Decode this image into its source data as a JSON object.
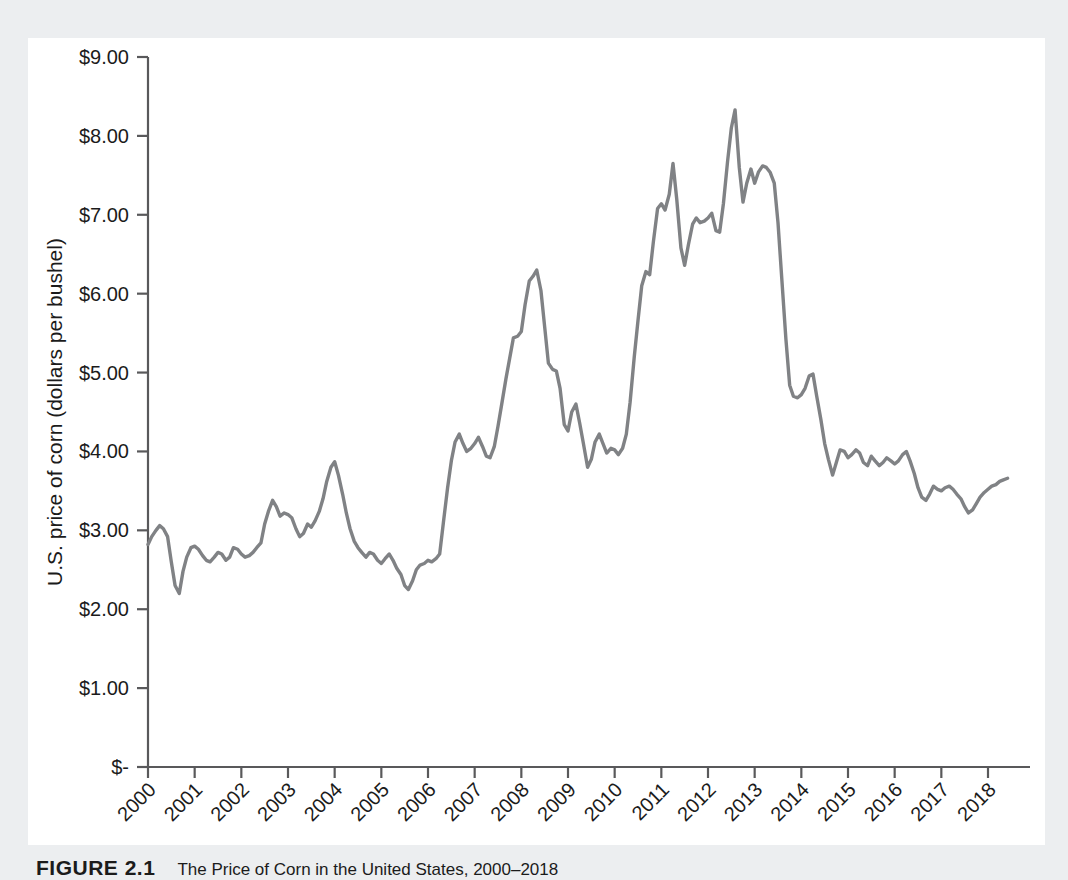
{
  "figure": {
    "caption_number": "FIGURE 2.1",
    "caption_text": "The Price of Corn in the United States, 2000–2018"
  },
  "chart_data": {
    "type": "line",
    "title": "",
    "xlabel": "",
    "ylabel": "U.S. price of corn (dollars per bushel)",
    "ylim": [
      0,
      9
    ],
    "xlim": [
      2000,
      2018.9
    ],
    "grid": false,
    "legend": "none",
    "line_color": "#808285",
    "axis_color": "#59595b",
    "background_color": "#ffffff",
    "page_background_color": "#eceef0",
    "ytick_values": [
      0,
      1,
      2,
      3,
      4,
      5,
      6,
      7,
      8,
      9
    ],
    "ytick_labels": [
      "$-",
      "$1.00",
      "$2.00",
      "$3.00",
      "$4.00",
      "$5.00",
      "$6.00",
      "$7.00",
      "$8.00",
      "$9.00"
    ],
    "xtick_values": [
      2000,
      2001,
      2002,
      2003,
      2004,
      2005,
      2006,
      2007,
      2008,
      2009,
      2010,
      2011,
      2012,
      2013,
      2014,
      2015,
      2016,
      2017,
      2018
    ],
    "xtick_labels": [
      "2000",
      "2001",
      "2002",
      "2003",
      "2004",
      "2005",
      "2006",
      "2007",
      "2008",
      "2009",
      "2010",
      "2011",
      "2012",
      "2013",
      "2014",
      "2015",
      "2016",
      "2017",
      "2018"
    ],
    "xtick_rotation_degrees": 45,
    "series": [
      {
        "name": "U.S. price of corn",
        "x": [
          2000.0,
          2000.08,
          2000.17,
          2000.25,
          2000.33,
          2000.42,
          2000.5,
          2000.58,
          2000.67,
          2000.75,
          2000.83,
          2000.92,
          2001.0,
          2001.08,
          2001.17,
          2001.25,
          2001.33,
          2001.42,
          2001.5,
          2001.58,
          2001.67,
          2001.75,
          2001.83,
          2001.92,
          2002.0,
          2002.08,
          2002.17,
          2002.25,
          2002.33,
          2002.42,
          2002.5,
          2002.58,
          2002.67,
          2002.75,
          2002.83,
          2002.92,
          2003.0,
          2003.08,
          2003.17,
          2003.25,
          2003.33,
          2003.42,
          2003.5,
          2003.58,
          2003.67,
          2003.75,
          2003.83,
          2003.92,
          2004.0,
          2004.08,
          2004.17,
          2004.25,
          2004.33,
          2004.42,
          2004.5,
          2004.58,
          2004.67,
          2004.75,
          2004.83,
          2004.92,
          2005.0,
          2005.08,
          2005.17,
          2005.25,
          2005.33,
          2005.42,
          2005.5,
          2005.58,
          2005.67,
          2005.75,
          2005.83,
          2005.92,
          2006.0,
          2006.08,
          2006.17,
          2006.25,
          2006.33,
          2006.42,
          2006.5,
          2006.58,
          2006.67,
          2006.75,
          2006.83,
          2006.92,
          2007.0,
          2007.08,
          2007.17,
          2007.25,
          2007.33,
          2007.42,
          2007.5,
          2007.58,
          2007.67,
          2007.75,
          2007.83,
          2007.92,
          2008.0,
          2008.08,
          2008.17,
          2008.25,
          2008.33,
          2008.42,
          2008.5,
          2008.58,
          2008.67,
          2008.75,
          2008.83,
          2008.92,
          2009.0,
          2009.08,
          2009.17,
          2009.25,
          2009.33,
          2009.42,
          2009.5,
          2009.58,
          2009.67,
          2009.75,
          2009.83,
          2009.92,
          2010.0,
          2010.08,
          2010.17,
          2010.25,
          2010.33,
          2010.42,
          2010.5,
          2010.58,
          2010.67,
          2010.75,
          2010.83,
          2010.92,
          2011.0,
          2011.08,
          2011.17,
          2011.25,
          2011.33,
          2011.42,
          2011.5,
          2011.58,
          2011.67,
          2011.75,
          2011.83,
          2011.92,
          2012.0,
          2012.08,
          2012.17,
          2012.25,
          2012.33,
          2012.42,
          2012.5,
          2012.58,
          2012.67,
          2012.75,
          2012.83,
          2012.92,
          2013.0,
          2013.08,
          2013.17,
          2013.25,
          2013.33,
          2013.42,
          2013.5,
          2013.58,
          2013.67,
          2013.75,
          2013.83,
          2013.92,
          2014.0,
          2014.08,
          2014.17,
          2014.25,
          2014.33,
          2014.42,
          2014.5,
          2014.58,
          2014.67,
          2014.75,
          2014.83,
          2014.92,
          2015.0,
          2015.08,
          2015.17,
          2015.25,
          2015.33,
          2015.42,
          2015.5,
          2015.58,
          2015.67,
          2015.75,
          2015.83,
          2015.92,
          2016.0,
          2016.08,
          2016.17,
          2016.25,
          2016.33,
          2016.42,
          2016.5,
          2016.58,
          2016.67,
          2016.75,
          2016.83,
          2016.92,
          2017.0,
          2017.08,
          2017.17,
          2017.25,
          2017.33,
          2017.42,
          2017.5,
          2017.58,
          2017.67,
          2017.75,
          2017.83,
          2017.92,
          2018.0,
          2018.08,
          2018.17,
          2018.25,
          2018.33,
          2018.42
        ],
        "y": [
          2.82,
          2.92,
          3.0,
          3.06,
          3.02,
          2.92,
          2.6,
          2.3,
          2.2,
          2.48,
          2.66,
          2.78,
          2.8,
          2.76,
          2.68,
          2.62,
          2.6,
          2.66,
          2.72,
          2.7,
          2.62,
          2.66,
          2.78,
          2.76,
          2.7,
          2.66,
          2.68,
          2.72,
          2.78,
          2.84,
          3.08,
          3.24,
          3.38,
          3.3,
          3.18,
          3.22,
          3.2,
          3.16,
          3.02,
          2.92,
          2.96,
          3.08,
          3.04,
          3.12,
          3.24,
          3.4,
          3.62,
          3.8,
          3.87,
          3.7,
          3.46,
          3.22,
          3.02,
          2.86,
          2.78,
          2.72,
          2.66,
          2.72,
          2.7,
          2.62,
          2.58,
          2.64,
          2.7,
          2.62,
          2.52,
          2.44,
          2.3,
          2.25,
          2.36,
          2.5,
          2.56,
          2.58,
          2.62,
          2.6,
          2.64,
          2.7,
          3.1,
          3.54,
          3.88,
          4.12,
          4.22,
          4.1,
          4.0,
          4.04,
          4.1,
          4.18,
          4.06,
          3.94,
          3.92,
          4.06,
          4.32,
          4.6,
          4.92,
          5.18,
          5.44,
          5.46,
          5.52,
          5.86,
          6.16,
          6.22,
          6.3,
          6.04,
          5.58,
          5.12,
          5.04,
          5.02,
          4.8,
          4.34,
          4.26,
          4.5,
          4.6,
          4.36,
          4.1,
          3.8,
          3.9,
          4.12,
          4.22,
          4.1,
          3.98,
          4.04,
          4.02,
          3.96,
          4.04,
          4.22,
          4.62,
          5.2,
          5.66,
          6.1,
          6.28,
          6.24,
          6.66,
          7.08,
          7.14,
          7.06,
          7.26,
          7.65,
          7.2,
          6.58,
          6.36,
          6.62,
          6.88,
          6.96,
          6.9,
          6.92,
          6.96,
          7.02,
          6.8,
          6.78,
          7.14,
          7.68,
          8.1,
          8.33,
          7.6,
          7.16,
          7.4,
          7.58,
          7.4,
          7.54,
          7.62,
          7.6,
          7.54,
          7.4,
          6.9,
          6.2,
          5.42,
          4.84,
          4.7,
          4.68,
          4.72,
          4.8,
          4.96,
          4.98,
          4.7,
          4.4,
          4.1,
          3.9,
          3.7,
          3.86,
          4.02,
          4.0,
          3.92,
          3.96,
          4.02,
          3.98,
          3.86,
          3.82,
          3.94,
          3.88,
          3.82,
          3.86,
          3.92,
          3.88,
          3.84,
          3.88,
          3.96,
          4.0,
          3.88,
          3.72,
          3.54,
          3.42,
          3.38,
          3.46,
          3.56,
          3.52,
          3.5,
          3.54,
          3.56,
          3.52,
          3.46,
          3.4,
          3.3,
          3.22,
          3.26,
          3.34,
          3.42,
          3.48,
          3.52,
          3.56,
          3.58,
          3.62,
          3.64,
          3.66
        ]
      }
    ]
  }
}
